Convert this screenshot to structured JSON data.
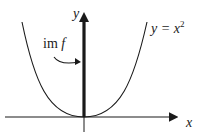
{
  "diagram": {
    "labels": {
      "y_axis": "y",
      "x_axis": "x",
      "curve_lhs": "y = x",
      "curve_exp": "2",
      "image_roman": "im ",
      "image_italic": "f"
    },
    "colors": {
      "stroke": "#1a1a1a",
      "background": "#ffffff"
    }
  }
}
